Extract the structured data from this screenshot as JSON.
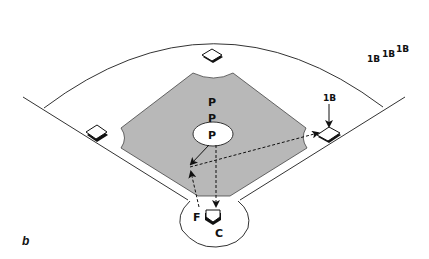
{
  "diagram": {
    "type": "baseball field play diagram",
    "panel_label": "b",
    "colors": {
      "infield": "#b8b8b8",
      "lines": "#333333",
      "background": "#ffffff",
      "base_fill": "#ffffff",
      "base_shadow": "#111111"
    },
    "labels": {
      "pitcher_positions": [
        "P",
        "P",
        "P"
      ],
      "first_base_sequence": [
        "1B",
        "1B",
        "1B"
      ],
      "first_base_marker": "1B",
      "fielder": "F",
      "catcher": "C"
    },
    "elements": [
      "outfield-arc",
      "foul-lines",
      "infield-diamond",
      "pitchers-mound",
      "home-plate-circle",
      "second-base",
      "third-base",
      "first-base",
      "home-plate"
    ],
    "arrows": [
      {
        "from": "pitcher",
        "to": "third-base-line-area",
        "style": "solid"
      },
      {
        "from": "pitcher",
        "to": "home-plate",
        "style": "dashed"
      },
      {
        "from": "fielder",
        "to": "third-base-line-area",
        "style": "dashed"
      },
      {
        "from": "third-base-line-area",
        "to": "first-base",
        "style": "dashed"
      },
      {
        "from": "1B-label",
        "to": "first-base",
        "style": "solid"
      }
    ]
  }
}
